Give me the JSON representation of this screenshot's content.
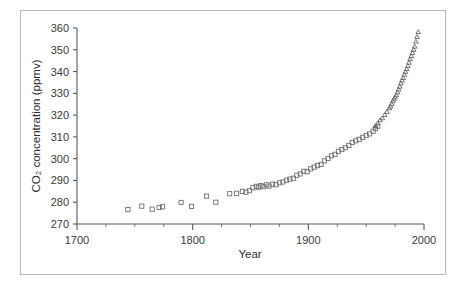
{
  "figure": {
    "background_color": "#ffffff",
    "frame_color": "#b9b9b9",
    "axis_color": "#5a5a5a"
  },
  "chart_data": {
    "type": "scatter",
    "title": "",
    "xlabel": "Year",
    "ylabel": "CO2 concentration (ppmv)",
    "ylabel_display": "CO₂ concentration (ppmv)",
    "xlim": [
      1700,
      2000
    ],
    "ylim": [
      270,
      360
    ],
    "xticks": [
      1700,
      1800,
      1900,
      2000
    ],
    "xtick_labels": [
      "1700",
      "1800",
      "1900",
      "2000"
    ],
    "x_minor_step": 25,
    "yticks": [
      270,
      280,
      290,
      300,
      310,
      320,
      330,
      340,
      350,
      360
    ],
    "ytick_labels": [
      "270",
      "280",
      "290",
      "300",
      "310",
      "320",
      "330",
      "340",
      "350",
      "360"
    ],
    "grid": false,
    "legend": "none",
    "series": [
      {
        "name": "ice-core",
        "marker": "square",
        "marker_size": 4.2,
        "color": "#6a6a6a",
        "points": [
          [
            1744,
            276.6
          ],
          [
            1756,
            278.2
          ],
          [
            1765,
            276.8
          ],
          [
            1771,
            277.6
          ],
          [
            1774,
            277.9
          ],
          [
            1790,
            279.9
          ],
          [
            1799,
            278.1
          ],
          [
            1812,
            282.8
          ],
          [
            1820,
            280.0
          ],
          [
            1832,
            283.9
          ],
          [
            1838,
            284.1
          ],
          [
            1843,
            285.0
          ],
          [
            1846,
            284.6
          ],
          [
            1849,
            285.3
          ],
          [
            1852,
            286.6
          ],
          [
            1855,
            287.3
          ],
          [
            1857,
            286.9
          ],
          [
            1859,
            287.6
          ],
          [
            1861,
            287.1
          ],
          [
            1864,
            288.0
          ],
          [
            1866,
            287.4
          ],
          [
            1869,
            288.3
          ],
          [
            1872,
            288.0
          ],
          [
            1875,
            288.9
          ],
          [
            1878,
            289.3
          ],
          [
            1881,
            290.1
          ],
          [
            1884,
            290.6
          ],
          [
            1887,
            291.0
          ],
          [
            1890,
            292.4
          ],
          [
            1893,
            293.0
          ],
          [
            1896,
            294.2
          ],
          [
            1899,
            294.0
          ],
          [
            1902,
            295.3
          ],
          [
            1905,
            296.1
          ],
          [
            1908,
            296.8
          ],
          [
            1911,
            297.4
          ],
          [
            1914,
            299.0
          ],
          [
            1917,
            300.1
          ],
          [
            1920,
            301.3
          ],
          [
            1923,
            302.0
          ],
          [
            1926,
            303.4
          ],
          [
            1929,
            304.2
          ],
          [
            1932,
            305.0
          ],
          [
            1935,
            306.1
          ],
          [
            1938,
            307.4
          ],
          [
            1941,
            308.2
          ],
          [
            1944,
            308.9
          ],
          [
            1947,
            309.8
          ],
          [
            1950,
            310.6
          ],
          [
            1953,
            311.4
          ],
          [
            1956,
            312.6
          ],
          [
            1958,
            313.8
          ],
          [
            1960,
            314.9
          ]
        ]
      },
      {
        "name": "mauna-loa",
        "marker": "triangle",
        "marker_size": 3.8,
        "color": "#5d5d5d",
        "points": [
          [
            1958,
            315.0
          ],
          [
            1960,
            316.3
          ],
          [
            1962,
            317.7
          ],
          [
            1964,
            318.6
          ],
          [
            1966,
            320.1
          ],
          [
            1968,
            321.5
          ],
          [
            1970,
            323.2
          ],
          [
            1971,
            324.0
          ],
          [
            1972,
            325.2
          ],
          [
            1973,
            326.4
          ],
          [
            1974,
            327.3
          ],
          [
            1975,
            328.2
          ],
          [
            1976,
            329.2
          ],
          [
            1977,
            330.5
          ],
          [
            1978,
            331.8
          ],
          [
            1979,
            333.1
          ],
          [
            1980,
            334.6
          ],
          [
            1981,
            335.9
          ],
          [
            1982,
            337.1
          ],
          [
            1983,
            338.6
          ],
          [
            1984,
            339.9
          ],
          [
            1985,
            341.2
          ],
          [
            1986,
            342.6
          ],
          [
            1987,
            344.1
          ],
          [
            1988,
            345.7
          ],
          [
            1989,
            347.1
          ],
          [
            1990,
            348.6
          ],
          [
            1991,
            350.0
          ],
          [
            1992,
            351.5
          ],
          [
            1993,
            353.8
          ],
          [
            1994,
            356.0
          ],
          [
            1995,
            358.2
          ]
        ]
      }
    ]
  }
}
